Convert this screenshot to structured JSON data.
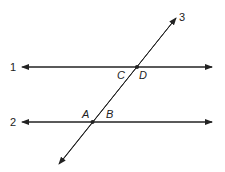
{
  "diagram": {
    "lines": [
      {
        "id": "1",
        "label": "1",
        "type": "horizontal"
      },
      {
        "id": "2",
        "label": "2",
        "type": "horizontal"
      },
      {
        "id": "3",
        "label": "3",
        "type": "transversal"
      }
    ],
    "angles": [
      {
        "label": "C",
        "at": "line1-transversal",
        "position": "below-left"
      },
      {
        "label": "D",
        "at": "line1-transversal",
        "position": "below-right"
      },
      {
        "label": "A",
        "at": "line2-transversal",
        "position": "above-left"
      },
      {
        "label": "B",
        "at": "line2-transversal",
        "position": "above-right"
      }
    ],
    "color": "#222222"
  }
}
